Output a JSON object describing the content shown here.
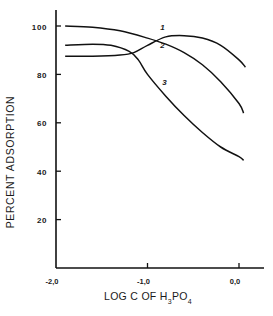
{
  "chart_data": {
    "type": "line",
    "title": "",
    "xlabel": "LOG C OF H3PO4",
    "xlabel_parts": {
      "main": "LOG  C  OF  H",
      "sub1": "3",
      "mid": "PO",
      "sub2": "4"
    },
    "ylabel": "PERCENT ADSORPTION",
    "xlim": [
      -2.0,
      0.25
    ],
    "ylim": [
      0,
      106
    ],
    "x_ticks": [
      -2.0,
      -1.0,
      0.0
    ],
    "x_tick_labels": [
      "-2,0",
      "-1,0",
      "0,0"
    ],
    "y_ticks": [
      20,
      40,
      60,
      80,
      100
    ],
    "y_tick_labels": [
      "20",
      "40",
      "60",
      "80",
      "100"
    ],
    "grid": false,
    "legend": "inline curve labels",
    "series": [
      {
        "name": "1",
        "x": [
          -1.9,
          -1.6,
          -1.3,
          -1.15,
          -1.0,
          -0.8,
          -0.6,
          -0.4,
          -0.2,
          0.0,
          0.07
        ],
        "y": [
          87.5,
          87.5,
          88,
          89,
          92,
          95.5,
          96,
          95,
          92,
          86,
          83
        ]
      },
      {
        "name": "2",
        "x": [
          -1.9,
          -1.6,
          -1.3,
          -1.0,
          -0.8,
          -0.6,
          -0.4,
          -0.2,
          0.0,
          0.05
        ],
        "y": [
          100,
          99.5,
          98,
          95,
          92.5,
          89,
          84,
          77,
          68,
          64
        ]
      },
      {
        "name": "3",
        "x": [
          -1.9,
          -1.6,
          -1.4,
          -1.2,
          -1.1,
          -1.0,
          -0.8,
          -0.6,
          -0.4,
          -0.2,
          0.0,
          0.05
        ],
        "y": [
          92,
          92.5,
          92,
          89.5,
          86,
          80,
          71,
          63,
          56,
          50,
          46,
          44.5
        ]
      }
    ],
    "curve_labels": [
      {
        "text": "1",
        "x": -0.86,
        "y": 98.5
      },
      {
        "text": "2",
        "x": -0.86,
        "y": 91
      },
      {
        "text": "3",
        "x": -0.84,
        "y": 75.5
      }
    ]
  }
}
